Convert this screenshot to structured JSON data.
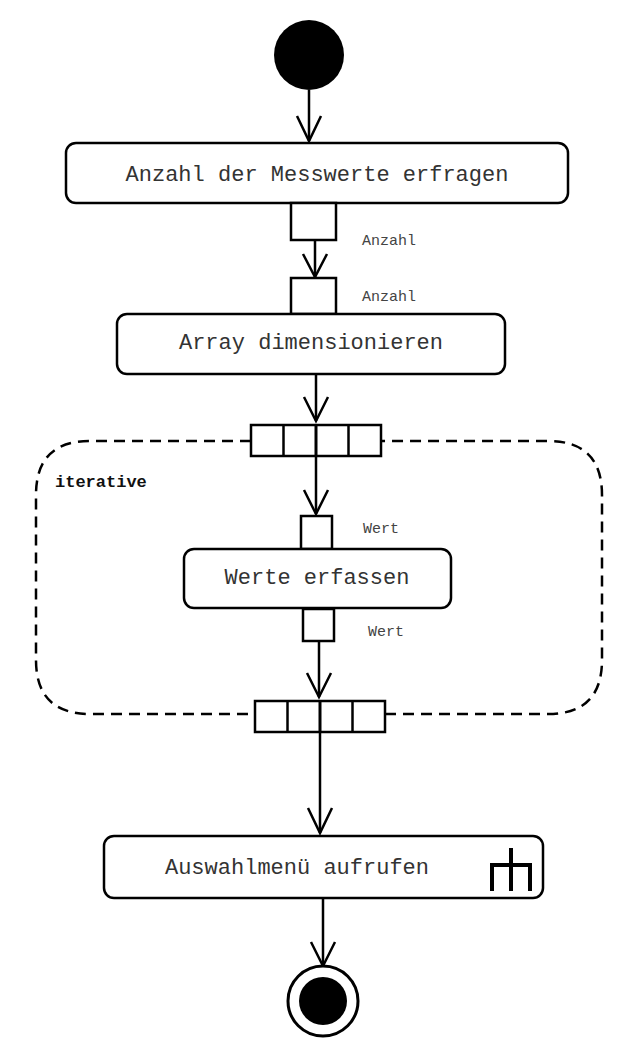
{
  "diagram": {
    "type": "UML activity diagram",
    "colors": {
      "stroke": "#000000",
      "text": "#333333",
      "background": "#ffffff"
    },
    "initial_node": {
      "label": ""
    },
    "actions": [
      {
        "id": "a1",
        "label": "Anzahl der Messwerte erfragen"
      },
      {
        "id": "a2",
        "label": "Array dimensionieren"
      },
      {
        "id": "a3",
        "label": "Werte erfassen"
      },
      {
        "id": "a4",
        "label": "Auswahlmenü aufrufen",
        "icon": "call-behavior-rake-icon"
      }
    ],
    "pins": [
      {
        "id": "p1",
        "label": "Anzahl",
        "kind": "output",
        "of": "a1"
      },
      {
        "id": "p2",
        "label": "Anzahl",
        "kind": "input",
        "of": "a2"
      },
      {
        "id": "p3",
        "label": "Wert",
        "kind": "input",
        "of": "a3"
      },
      {
        "id": "p4",
        "label": "Wert",
        "kind": "output",
        "of": "a3"
      }
    ],
    "expansion_region": {
      "mode": "iterative",
      "input_node_cells": 4,
      "output_node_cells": 4
    },
    "final_node": {
      "label": ""
    }
  }
}
